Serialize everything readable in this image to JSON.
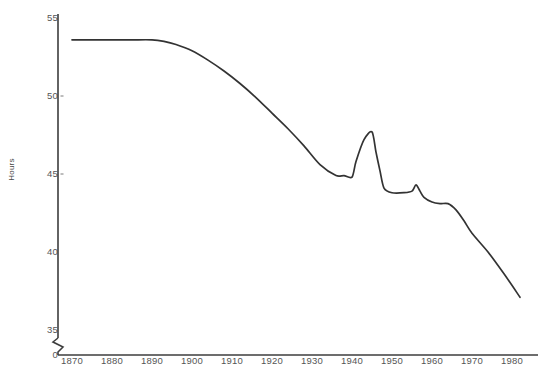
{
  "chart_data": {
    "type": "line",
    "title": "",
    "xlabel": "",
    "ylabel": "Hours",
    "xlim": [
      1870,
      1982
    ],
    "ylim": [
      35,
      55
    ],
    "y_axis_break": true,
    "y_break_label": "0",
    "grid": false,
    "legend": "none",
    "line_color": "#333333",
    "ytick_labels": [
      "55",
      "50",
      "45",
      "40",
      "35",
      "0"
    ],
    "ytick_values": [
      55,
      50,
      45,
      40,
      35,
      0
    ],
    "xtick_labels": [
      "1870",
      "1880",
      "1890",
      "1900",
      "1910",
      "1920",
      "1930",
      "1940",
      "1950",
      "1960",
      "1970",
      "1980"
    ],
    "xtick_values": [
      1870,
      1880,
      1890,
      1900,
      1910,
      1920,
      1930,
      1940,
      1950,
      1960,
      1970,
      1980
    ],
    "series": [
      {
        "name": "Average weekly hours of work",
        "x": [
          1870,
          1875,
          1880,
          1885,
          1890,
          1893,
          1896,
          1900,
          1904,
          1908,
          1912,
          1916,
          1920,
          1924,
          1928,
          1932,
          1936,
          1938,
          1940,
          1941,
          1943,
          1945,
          1946,
          1947,
          1948,
          1950,
          1953,
          1955,
          1956,
          1957,
          1958,
          1960,
          1962,
          1964,
          1966,
          1968,
          1970,
          1974,
          1978,
          1982
        ],
        "y": [
          53.6,
          53.6,
          53.6,
          53.6,
          53.6,
          53.5,
          53.3,
          52.9,
          52.3,
          51.6,
          50.8,
          49.9,
          48.9,
          47.9,
          46.8,
          45.6,
          44.9,
          44.9,
          44.8,
          45.8,
          47.2,
          47.7,
          46.4,
          45.2,
          44.1,
          43.8,
          43.8,
          43.9,
          44.3,
          43.9,
          43.5,
          43.2,
          43.1,
          43.1,
          42.7,
          42.0,
          41.2,
          40.0,
          38.6,
          37.1
        ]
      }
    ]
  },
  "axis": {
    "y_axis_title": "Hours"
  }
}
